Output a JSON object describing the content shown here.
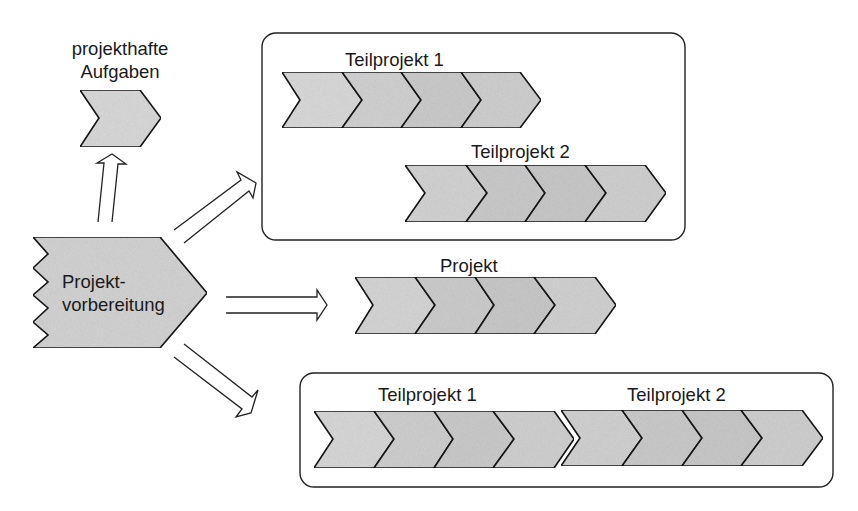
{
  "diagram": {
    "colors": {
      "stroke": "#1a1a1a",
      "fill_light": "#dcdcdc",
      "fill_mid": "#d2d2d2",
      "fill_dark": "#c9c9c9",
      "background": "#ffffff"
    },
    "source_node": {
      "label_line1": "Projekt-",
      "label_line2": "vorbereitung"
    },
    "tasks_node": {
      "label_line1": "projekthafte",
      "label_line2": "Aufgaben"
    },
    "parallel_group": {
      "subproject_1_label": "Teilprojekt 1",
      "subproject_2_label": "Teilprojekt 2",
      "subproject_1_phases": 4,
      "subproject_2_phases": 4
    },
    "single_project": {
      "label": "Projekt",
      "phases": 4
    },
    "sequential_group": {
      "subproject_1_label": "Teilprojekt 1",
      "subproject_2_label": "Teilprojekt 2",
      "subproject_1_phases": 4,
      "subproject_2_phases": 4
    },
    "arrows": [
      {
        "from": "Projektvorbereitung",
        "to": "projekthafte Aufgaben",
        "direction": "up"
      },
      {
        "from": "Projektvorbereitung",
        "to": "parallel Teilprojekte",
        "direction": "up-right"
      },
      {
        "from": "Projektvorbereitung",
        "to": "Projekt",
        "direction": "right"
      },
      {
        "from": "Projektvorbereitung",
        "to": "sequential Teilprojekte",
        "direction": "down-right"
      }
    ]
  }
}
